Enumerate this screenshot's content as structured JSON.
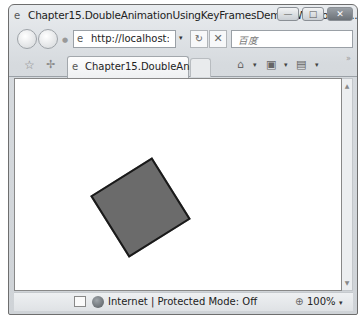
{
  "window": {
    "title": "Chapter15.DoubleAnimationUsingKeyFramesDemo - Windows I...",
    "title_icon": "ie-icon",
    "controls": {
      "minimize": "—",
      "maximize": "□",
      "close": "✕"
    }
  },
  "navbar": {
    "back_icon": "back-arrow-icon",
    "forward_icon": "forward-arrow-icon",
    "address": "http://localhost:53̸",
    "address_value": "http://localhost:538",
    "address_dropdown": "▾",
    "refresh_glyph": "⁴⁄",
    "refresh_label": "↻",
    "stop_label": "✕",
    "search_placeholder": "百度"
  },
  "tabbar": {
    "favorites_glyph": "☆",
    "add_favorites_glyph": "✢",
    "tabs": [
      {
        "label": "Chapter15.DoubleAnim...",
        "active": true
      }
    ],
    "commands": [
      {
        "name": "home",
        "glyph": "⌂"
      },
      {
        "name": "feeds",
        "glyph": "▣"
      },
      {
        "name": "print",
        "glyph": "▤"
      }
    ],
    "dropdown_glyph": "▾",
    "more_glyph": "»"
  },
  "content": {
    "shape": {
      "type": "rectangle",
      "fill": "#6b6b6b",
      "stroke": "#1a1a1a",
      "rotation_deg": -32
    }
  },
  "scrollbar": {
    "up": "▲",
    "down": "▼"
  },
  "statusbar": {
    "zone_text": "Internet | Protected Mode: Off",
    "zoom_icon": "⊕",
    "zoom": "100%",
    "zoom_dropdown": "▾"
  }
}
